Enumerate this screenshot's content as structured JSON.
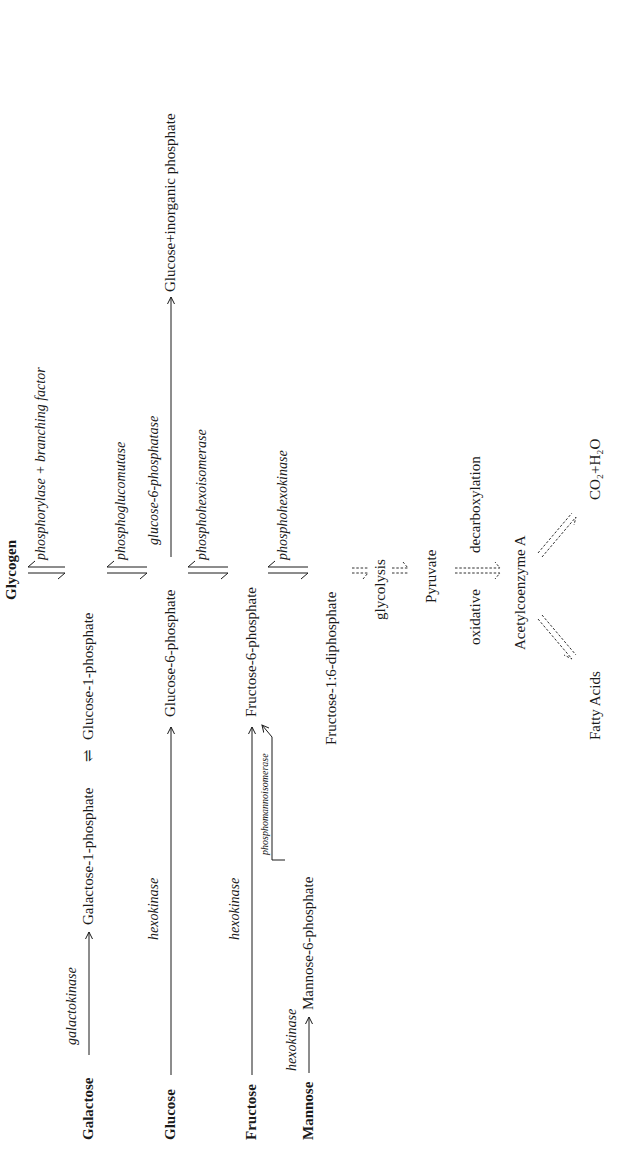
{
  "diagram": {
    "orientation": "rotated 90 degrees counter-clockwise",
    "substrates": {
      "galactose": "Galactose",
      "glucose": "Glucose",
      "fructose": "Fructose",
      "mannose": "Mannose"
    },
    "compounds": {
      "glycogen": "Glycogen",
      "galactose_1_phosphate": "Galactose-1-phosphate",
      "equilibrium_symbol": "⇌",
      "glucose_1_phosphate": "Glucose-1-phosphate",
      "glucose_6_phosphate": "Glucose-6-phosphate",
      "glucose_inorganic_phosphate": "Glucose+inorganic phosphate",
      "fructose_6_phosphate": "Fructose-6-phosphate",
      "mannose_6_phosphate": "Mannose-6-phosphate",
      "fructose_1_6_diphosphate": "Fructose-1:6-diphosphate",
      "pyruvate": "Pyruvate",
      "acetylcoenzyme_a": "Acetylcoenzyme A",
      "fatty_acids": "Fatty Acids",
      "co2_h2o": "CO₂+H₂O"
    },
    "enzymes": {
      "galactokinase": "galactokinase",
      "hexokinase_glucose": "hexokinase",
      "hexokinase_fructose": "hexokinase",
      "hexokinase_mannose": "hexokinase",
      "phosphomannoisomerase": "phosphomannoisomerase",
      "phosphorylase": "phosphorylase + branching factor",
      "phosphoglucomutase": "phosphoglucomutase",
      "glucose_6_phosphatase": "glucose-6-phosphatase",
      "phosphohexoisomerase": "phosphohexoisomerase",
      "phosphohexokinase": "phosphohexokinase"
    },
    "process_labels": {
      "glycolysis": "glycolysis",
      "oxidative": "oxidative",
      "decarboxylation": "decarboxylation"
    }
  }
}
